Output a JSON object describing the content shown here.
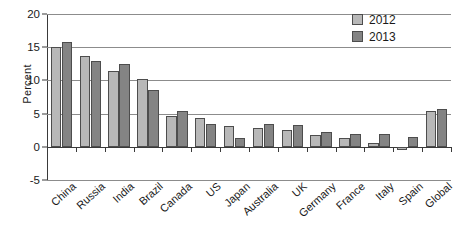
{
  "chart_data": {
    "type": "bar",
    "title": "",
    "xlabel": "",
    "ylabel": "Percent",
    "ylim": [
      -5,
      20
    ],
    "yticks": [
      20,
      15,
      10,
      5,
      0,
      -5
    ],
    "grid": true,
    "legend_position": "top-right",
    "categories": [
      "China",
      "Russia",
      "India",
      "Brazil",
      "Canada",
      "US",
      "Japan",
      "Australia",
      "UK",
      "Germany",
      "France",
      "Italy",
      "Spain",
      "Global"
    ],
    "series": [
      {
        "name": "2012",
        "color": "#b8b8b8",
        "values": [
          15.0,
          13.7,
          11.4,
          10.2,
          4.7,
          4.3,
          3.2,
          2.9,
          2.5,
          1.8,
          1.3,
          0.5,
          -0.5,
          5.4
        ]
      },
      {
        "name": "2013",
        "color": "#848484",
        "values": [
          15.8,
          12.9,
          12.5,
          8.6,
          5.4,
          3.4,
          1.3,
          3.5,
          3.3,
          2.2,
          2.0,
          1.9,
          1.5,
          5.7
        ]
      }
    ]
  },
  "axis": {
    "y_title": "Percent"
  }
}
